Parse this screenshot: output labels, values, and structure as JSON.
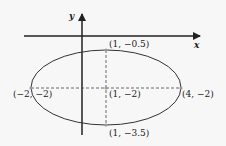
{
  "diagram": {
    "type": "ellipse-on-coordinate-plane",
    "axes": {
      "x_label": "x",
      "y_label": "y"
    },
    "ellipse": {
      "center": {
        "label": "(1, −2)",
        "x": 1,
        "y": -2
      },
      "vertices": [
        {
          "id": "left",
          "label": "(−2, −2)",
          "x": -2,
          "y": -2
        },
        {
          "id": "right",
          "label": "(4, −2)",
          "x": 4,
          "y": -2
        }
      ],
      "co_vertices": [
        {
          "id": "top",
          "label": "(1, −0.5)",
          "x": 1,
          "y": -0.5
        },
        {
          "id": "bottom",
          "label": "(1, −3.5)",
          "x": 1,
          "y": -3.5
        }
      ],
      "major_axis": "horizontal dashed",
      "minor_axis": "vertical dashed"
    },
    "colors": {
      "stroke": "#222222",
      "point": "#9a9a9a",
      "background": "#f7f7f7"
    }
  }
}
